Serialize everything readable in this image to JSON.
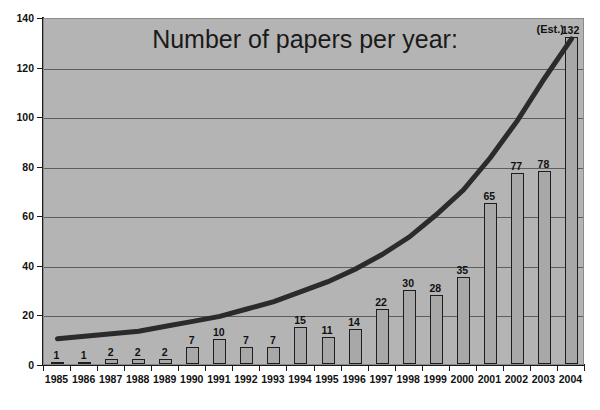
{
  "chart_data": {
    "type": "bar",
    "title": "Number of papers per year:",
    "xlabel": "",
    "ylabel": "",
    "categories": [
      "1985",
      "1986",
      "1987",
      "1988",
      "1989",
      "1990",
      "1991",
      "1992",
      "1993",
      "1994",
      "1995",
      "1996",
      "1997",
      "1998",
      "1999",
      "2000",
      "2001",
      "2002",
      "2003",
      "2004"
    ],
    "values": [
      1,
      1,
      2,
      2,
      2,
      7,
      10,
      7,
      7,
      15,
      11,
      14,
      22,
      30,
      28,
      35,
      65,
      77,
      78,
      132
    ],
    "ylim": [
      0,
      140
    ],
    "ytick_labels": [
      "0",
      "20",
      "40",
      "60",
      "80",
      "100",
      "120",
      "140"
    ],
    "ytick_values": [
      0,
      20,
      40,
      60,
      80,
      100,
      120,
      140
    ],
    "grid": true,
    "legend": "none",
    "annotations": [
      {
        "text": "(Est.)",
        "category": "2004",
        "note": "estimate marker above final bar"
      }
    ],
    "series": [
      {
        "name": "Number of papers",
        "type": "bar",
        "values": [
          1,
          1,
          2,
          2,
          2,
          7,
          10,
          7,
          7,
          15,
          11,
          14,
          22,
          30,
          28,
          35,
          65,
          77,
          78,
          132
        ]
      },
      {
        "name": "Exponential trend",
        "type": "line",
        "values": [
          11,
          12,
          13,
          14,
          16,
          18,
          20,
          23,
          26,
          30,
          34,
          39,
          45,
          52,
          61,
          71,
          84,
          99,
          116,
          132
        ]
      }
    ]
  },
  "colors": {
    "plot_background": "#b4b4b4",
    "bar_fill": "#a8a8a8",
    "bar_outline": "#1d1d1d",
    "gridline": "#5d5d5d",
    "axis": "#1a1a1a",
    "trend_line": "#2b2b2b",
    "text": "#111111",
    "page_background": "#ffffff"
  }
}
